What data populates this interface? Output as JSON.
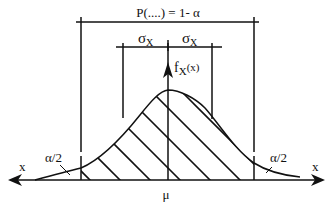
{
  "diagram": {
    "type": "normal-distribution-confidence-interval",
    "probability_label": "P(....) = 1- α",
    "sigma_left_label": "σ",
    "sigma_left_sub": "X",
    "sigma_right_label": "σ",
    "sigma_right_sub": "X",
    "density_label": "f",
    "density_sub": "X",
    "density_arg": "(x)",
    "left_tail_label": "α/2",
    "right_tail_label": "α/2",
    "left_axis_label": "x",
    "right_axis_label": "x",
    "mean_label": "μ",
    "colors": {
      "ink": "#111111",
      "background": "#ffffff"
    }
  }
}
